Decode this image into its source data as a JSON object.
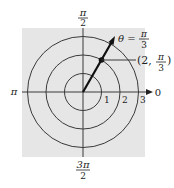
{
  "diagram": {
    "type": "polar-coordinate-plot",
    "background_color": "#e6e6e6",
    "line_color": "#333333",
    "angle_labels": {
      "top": {
        "num": "π",
        "den": "2"
      },
      "left": "π",
      "right": "0",
      "bottom": {
        "num": "3π",
        "den": "2"
      }
    },
    "radius_labels": [
      "1",
      "2",
      "3"
    ],
    "ray": {
      "label_prefix": "θ =",
      "label_num": "π",
      "label_den": "3"
    },
    "point": {
      "label_open": "(2,",
      "label_num": "π",
      "label_den": "3",
      "label_close": ")",
      "r": 2,
      "theta": "π/3"
    }
  }
}
